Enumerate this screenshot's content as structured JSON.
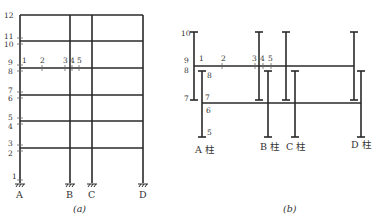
{
  "figure_a": {
    "caption": "(a)",
    "columns": [
      {
        "label": "A",
        "x": 20
      },
      {
        "label": "B",
        "x": 70
      },
      {
        "label": "C",
        "x": 92
      },
      {
        "label": "D",
        "x": 143
      }
    ],
    "floor_levels_y": [
      15,
      41,
      68,
      95,
      121,
      148
    ],
    "ground_y": 183,
    "section_labels": [
      {
        "text": "12",
        "x": 4,
        "y": 18
      },
      {
        "text": "11",
        "x": 4,
        "y": 39
      },
      {
        "text": "10",
        "x": 4,
        "y": 47
      },
      {
        "text": "9",
        "x": 8,
        "y": 65
      },
      {
        "text": "8",
        "x": 8,
        "y": 74
      },
      {
        "text": "7",
        "x": 8,
        "y": 93
      },
      {
        "text": "6",
        "x": 8,
        "y": 101
      },
      {
        "text": "5",
        "x": 8,
        "y": 120
      },
      {
        "text": "4",
        "x": 8,
        "y": 129
      },
      {
        "text": "3",
        "x": 8,
        "y": 146
      },
      {
        "text": "2",
        "x": 8,
        "y": 156
      },
      {
        "text": "1",
        "x": 12,
        "y": 179
      }
    ],
    "beam_labels": [
      {
        "text": "1",
        "x": 22,
        "y": 63
      },
      {
        "text": "2",
        "x": 40,
        "y": 63
      },
      {
        "text": "3",
        "x": 63,
        "y": 63
      },
      {
        "text": "4",
        "x": 70,
        "y": 63
      },
      {
        "text": "5",
        "x": 77,
        "y": 63
      }
    ],
    "beam_marks_x": [
      20,
      42,
      65,
      72,
      79
    ]
  },
  "figure_b": {
    "caption": "(b)",
    "column_labels": [
      {
        "text": "A 柱",
        "x": 196,
        "y": 153
      },
      {
        "text": "B 柱",
        "x": 260,
        "y": 150
      },
      {
        "text": "C 柱",
        "x": 287,
        "y": 150
      },
      {
        "text": "D 柱",
        "x": 352,
        "y": 148
      }
    ],
    "upper_columns_x": [
      194,
      259,
      286,
      354
    ],
    "lower_columns_x": [
      202,
      268,
      295,
      361
    ],
    "upper_column_range": [
      32,
      100
    ],
    "lower_column_range": [
      71,
      137
    ],
    "upper_beam_y": 66,
    "lower_beam_y": 103,
    "section_labels": [
      {
        "text": "10",
        "x": 183,
        "y": 36
      },
      {
        "text": "9",
        "x": 184,
        "y": 63
      },
      {
        "text": "8",
        "x": 184,
        "y": 73
      },
      {
        "text": "7",
        "x": 184,
        "y": 101
      },
      {
        "text": "1",
        "x": 199,
        "y": 61
      },
      {
        "text": "2",
        "x": 222,
        "y": 61
      },
      {
        "text": "3",
        "x": 253,
        "y": 61
      },
      {
        "text": "4",
        "x": 261,
        "y": 61
      },
      {
        "text": "5",
        "x": 269,
        "y": 61
      },
      {
        "text": "8",
        "x": 207,
        "y": 77
      },
      {
        "text": "7",
        "x": 205,
        "y": 101
      },
      {
        "text": "6",
        "x": 206,
        "y": 114
      },
      {
        "text": "5",
        "x": 207,
        "y": 135
      }
    ]
  }
}
